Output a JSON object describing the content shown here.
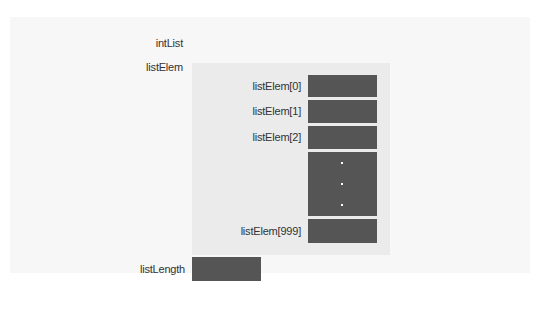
{
  "diagram": {
    "struct_name": "intList",
    "array_field": {
      "name": "listElem",
      "elements": [
        {
          "label": "listElem[0]"
        },
        {
          "label": "listElem[1]"
        },
        {
          "label": "listElem[2]"
        },
        {
          "label": "",
          "ellipsis": "⋮"
        },
        {
          "label": "listElem[999]"
        }
      ]
    },
    "length_field": {
      "name": "listLength"
    },
    "colors": {
      "cell_fill": "#555555",
      "array_region": "#ebebeb",
      "struct_region": "#f7f7f7",
      "text": "#333333"
    }
  }
}
